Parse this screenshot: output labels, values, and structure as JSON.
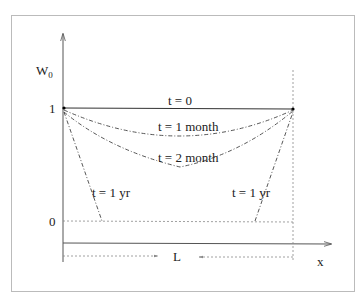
{
  "diagram": {
    "y_axis": {
      "label": "W",
      "label_subscript": "0",
      "ticks": [
        "1",
        "0"
      ]
    },
    "x_axis": {
      "label": "x"
    },
    "span_label": "L",
    "curves": [
      {
        "id": "t0",
        "label": "t = 0",
        "style": "solid",
        "min_value": 1.0
      },
      {
        "id": "t1m",
        "label": "t = 1 month",
        "style": "dash-dot",
        "min_value": 0.75
      },
      {
        "id": "t2m",
        "label": "t = 2 month",
        "style": "dash-dot",
        "min_value": 0.48
      },
      {
        "id": "t1yr",
        "label_left": "t = 1 yr",
        "label_right": "t = 1 yr",
        "style": "dash-dot",
        "min_value": 0.0,
        "flat_fraction": [
          0.17,
          0.83
        ]
      }
    ],
    "colors": {
      "line": "#333333",
      "frame": "#bbbbbb",
      "guide": "#888888"
    }
  }
}
